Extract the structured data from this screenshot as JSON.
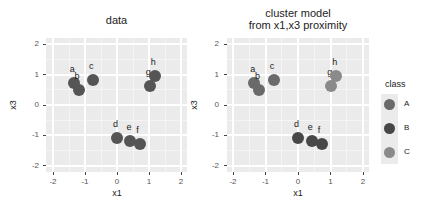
{
  "chart_data": [
    {
      "type": "scatter",
      "title": "data",
      "xlabel": "x1",
      "ylabel": "x3",
      "xlim": [
        -2.2,
        2.2
      ],
      "ylim": [
        -2.2,
        2.2
      ],
      "xticks": [
        -2,
        -1,
        0,
        1,
        2
      ],
      "yticks": [
        -2,
        -1,
        0,
        1,
        2
      ],
      "grid": true,
      "points": [
        {
          "label": "a",
          "x": -1.35,
          "y": 0.72,
          "color": "#555555"
        },
        {
          "label": "b",
          "x": -1.2,
          "y": 0.5,
          "color": "#555555"
        },
        {
          "label": "c",
          "x": -0.75,
          "y": 0.82,
          "color": "#555555"
        },
        {
          "label": "d",
          "x": 0.0,
          "y": -1.08,
          "color": "#555555"
        },
        {
          "label": "e",
          "x": 0.42,
          "y": -1.18,
          "color": "#555555"
        },
        {
          "label": "f",
          "x": 0.73,
          "y": -1.3,
          "color": "#555555"
        },
        {
          "label": "g",
          "x": 1.02,
          "y": 0.62,
          "color": "#555555"
        },
        {
          "label": "h",
          "x": 1.18,
          "y": 0.95,
          "color": "#555555"
        }
      ]
    },
    {
      "type": "scatter",
      "title": "cluster model\nfrom x1,x3 proximity",
      "title_lines": [
        "cluster model",
        "from x1,x3 proximity"
      ],
      "xlabel": "x1",
      "ylabel": "x3",
      "xlim": [
        -2.2,
        2.2
      ],
      "ylim": [
        -2.2,
        2.2
      ],
      "xticks": [
        -2,
        -1,
        0,
        1,
        2
      ],
      "yticks": [
        -2,
        -1,
        0,
        1,
        2
      ],
      "grid": true,
      "legend": {
        "title": "class",
        "position": "right",
        "entries": [
          {
            "label": "A",
            "color": "#6a6a6a"
          },
          {
            "label": "B",
            "color": "#474747"
          },
          {
            "label": "C",
            "color": "#8a8a8a"
          }
        ]
      },
      "points": [
        {
          "label": "a",
          "x": -1.35,
          "y": 0.72,
          "class": "A",
          "color": "#6a6a6a"
        },
        {
          "label": "b",
          "x": -1.2,
          "y": 0.5,
          "class": "A",
          "color": "#6a6a6a"
        },
        {
          "label": "c",
          "x": -0.75,
          "y": 0.82,
          "class": "A",
          "color": "#6a6a6a"
        },
        {
          "label": "d",
          "x": 0.0,
          "y": -1.08,
          "class": "B",
          "color": "#474747"
        },
        {
          "label": "e",
          "x": 0.42,
          "y": -1.18,
          "class": "B",
          "color": "#474747"
        },
        {
          "label": "f",
          "x": 0.73,
          "y": -1.3,
          "class": "B",
          "color": "#474747"
        },
        {
          "label": "g",
          "x": 1.02,
          "y": 0.62,
          "class": "C",
          "color": "#8a8a8a"
        },
        {
          "label": "h",
          "x": 1.18,
          "y": 0.95,
          "class": "C",
          "color": "#8a8a8a"
        }
      ]
    }
  ]
}
